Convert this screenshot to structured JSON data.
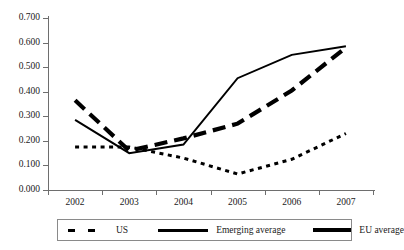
{
  "chart_data": {
    "type": "line",
    "title": "",
    "xlabel": "",
    "ylabel": "",
    "categories": [
      "2002",
      "2003",
      "2004",
      "2005",
      "2006",
      "2007"
    ],
    "ylim": [
      0.0,
      0.7
    ],
    "ytick_labels": [
      "0.000",
      "0.100",
      "0.200",
      "0.300",
      "0.400",
      "0.500",
      "0.600",
      "0.700"
    ],
    "ytick_values": [
      0.0,
      0.1,
      0.2,
      0.3,
      0.4,
      0.5,
      0.6,
      0.7
    ],
    "grid": false,
    "legend_position": "bottom",
    "series": [
      {
        "name": "US",
        "style": "dotted",
        "color": "#000000",
        "values": [
          0.175,
          0.175,
          0.13,
          0.065,
          0.125,
          0.23
        ]
      },
      {
        "name": "Emerging average",
        "style": "solid",
        "color": "#000000",
        "values": [
          0.285,
          0.15,
          0.185,
          0.455,
          0.55,
          0.585
        ]
      },
      {
        "name": "EU average",
        "style": "dashed",
        "color": "#000000",
        "values": [
          0.365,
          0.16,
          0.21,
          0.27,
          0.405,
          0.58
        ]
      }
    ]
  },
  "legend": {
    "items": [
      {
        "label": "US",
        "marker": "dotted-line-marker"
      },
      {
        "label": "Emerging average",
        "marker": "solid-line-marker"
      },
      {
        "label": "EU average",
        "marker": "thick-dashed-line-marker"
      }
    ]
  }
}
